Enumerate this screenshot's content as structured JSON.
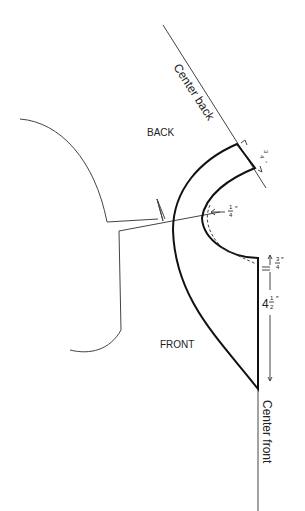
{
  "diagram": {
    "type": "pattern-drafting",
    "labels": {
      "center_back": "Center back",
      "center_front": "Center front",
      "back": "BACK",
      "front": "FRONT"
    },
    "measurements": {
      "shoulder_width": {
        "whole": "",
        "num": "3",
        "den": "4",
        "unit": "″"
      },
      "neckline_offset": {
        "whole": "",
        "num": "1",
        "den": "4",
        "unit": "″"
      },
      "front_top_drop": {
        "whole": "",
        "num": "3",
        "den": "4",
        "unit": "″"
      },
      "front_length": {
        "whole": "4",
        "num": "1",
        "den": "2",
        "unit": "″"
      }
    },
    "colors": {
      "line": "#111111",
      "thin_line": "#444444",
      "background": "#ffffff"
    }
  }
}
